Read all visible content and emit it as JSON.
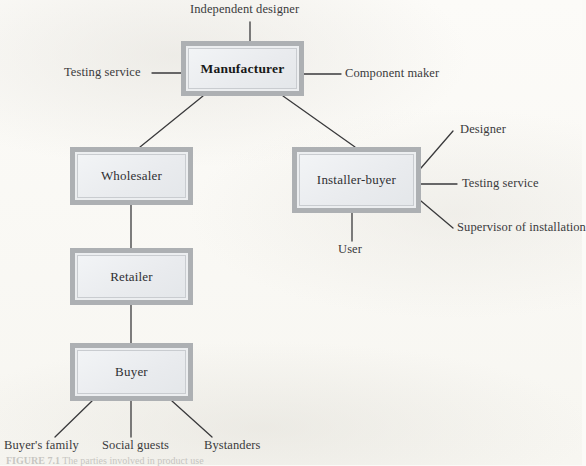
{
  "figure": {
    "type": "hierarchy-diagram",
    "background_color": "#fbfaf7",
    "node_fill_color": "#eceef0",
    "node_frame_color": "#adb0b3",
    "ink_color": "#2f2f32",
    "caption_number": "FIGURE 7.1",
    "caption_text": "The parties involved in product use"
  },
  "nodes": [
    {
      "id": "manufacturer",
      "label": "Manufacturer",
      "emphasis": true
    },
    {
      "id": "wholesaler",
      "label": "Wholesaler",
      "emphasis": false
    },
    {
      "id": "installer-buyer",
      "label": "Installer-buyer",
      "emphasis": false
    },
    {
      "id": "retailer",
      "label": "Retailer",
      "emphasis": false
    },
    {
      "id": "buyer",
      "label": "Buyer",
      "emphasis": false
    }
  ],
  "external_labels": [
    {
      "id": "independent-designer",
      "label": "Independent designer",
      "attaches_to": "manufacturer",
      "side": "top"
    },
    {
      "id": "testing-service-mfr",
      "label": "Testing service",
      "attaches_to": "manufacturer",
      "side": "left"
    },
    {
      "id": "component-maker",
      "label": "Component maker",
      "attaches_to": "manufacturer",
      "side": "right"
    },
    {
      "id": "designer",
      "label": "Designer",
      "attaches_to": "installer-buyer",
      "side": "right"
    },
    {
      "id": "testing-service-installer",
      "label": "Testing service",
      "attaches_to": "installer-buyer",
      "side": "right"
    },
    {
      "id": "supervisor-of-installation",
      "label": "Supervisor of installation",
      "attaches_to": "installer-buyer",
      "side": "right"
    },
    {
      "id": "user",
      "label": "User",
      "attaches_to": "installer-buyer",
      "side": "bottom"
    },
    {
      "id": "buyers-family",
      "label": "Buyer's family",
      "attaches_to": "buyer",
      "side": "bottom"
    },
    {
      "id": "social-guests",
      "label": "Social guests",
      "attaches_to": "buyer",
      "side": "bottom"
    },
    {
      "id": "bystanders",
      "label": "Bystanders",
      "attaches_to": "buyer",
      "side": "bottom"
    }
  ],
  "edges": [
    {
      "from": "manufacturer",
      "to": "wholesaler"
    },
    {
      "from": "manufacturer",
      "to": "installer-buyer"
    },
    {
      "from": "wholesaler",
      "to": "retailer"
    },
    {
      "from": "retailer",
      "to": "buyer"
    }
  ]
}
